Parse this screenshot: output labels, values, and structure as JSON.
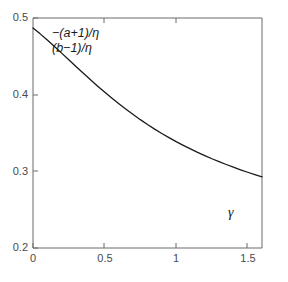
{
  "chart_data": {
    "type": "line",
    "title": "",
    "xlabel": "γ",
    "ylabel": "",
    "xlim": [
      0,
      1.6
    ],
    "ylim": [
      0.2,
      0.5
    ],
    "grid": false,
    "legend_position": "none",
    "xticks": [
      "0",
      "0.5",
      "1",
      "1.5"
    ],
    "xtick_values": [
      0,
      0.5,
      1,
      1.5
    ],
    "yticks": [
      "0.5",
      "0.4",
      "0.3",
      "0.2"
    ],
    "ytick_values": [
      0.5,
      0.4,
      0.3,
      0.2
    ],
    "annotations": [
      {
        "text": "−(a+1)/η",
        "x": 0.16,
        "y": 0.472
      },
      {
        "text": "(b−1)/η",
        "x": 0.16,
        "y": 0.453
      }
    ],
    "series": [
      {
        "name": "-(a+1)/η = (b-1)/η",
        "color": "#1a1a1a",
        "x": [
          0.0,
          0.05,
          0.1,
          0.15,
          0.2,
          0.25,
          0.3,
          0.35,
          0.4,
          0.45,
          0.5,
          0.55,
          0.6,
          0.65,
          0.7,
          0.75,
          0.8,
          0.85,
          0.9,
          0.95,
          1.0,
          1.05,
          1.1,
          1.15,
          1.2,
          1.25,
          1.3,
          1.35,
          1.4,
          1.45,
          1.5,
          1.55,
          1.6
        ],
        "y": [
          0.487,
          0.4793,
          0.4712,
          0.4628,
          0.4542,
          0.4455,
          0.4368,
          0.4282,
          0.4197,
          0.4114,
          0.4034,
          0.3956,
          0.3881,
          0.3809,
          0.374,
          0.3674,
          0.3611,
          0.3551,
          0.3494,
          0.344,
          0.3388,
          0.3339,
          0.3292,
          0.3247,
          0.3205,
          0.3164,
          0.3126,
          0.3089,
          0.3054,
          0.302,
          0.2988,
          0.2957,
          0.2928
        ]
      }
    ]
  },
  "axes": {
    "y_tick_labels": [
      "0.5",
      "0.4",
      "0.3",
      "0.2"
    ],
    "x_tick_labels": [
      "0",
      "0.5",
      "1",
      "1.5"
    ],
    "x_axis_symbol": "γ"
  },
  "annotation": {
    "line1": "−(a+1)/η",
    "line2": "(b−1)/η"
  },
  "colors": {
    "curve": "#1a1a1a",
    "axis": "#555555",
    "background": "#ffffff",
    "tick_text": "#4a4a4a"
  }
}
